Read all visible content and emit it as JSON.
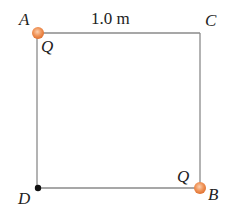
{
  "diagram": {
    "type": "square-charge-configuration",
    "side_length_label": "1.0 m",
    "corners": {
      "A": {
        "label": "A",
        "charge_label": "Q",
        "has_charge": true
      },
      "B": {
        "label": "B",
        "charge_label": "Q",
        "has_charge": true
      },
      "C": {
        "label": "C",
        "has_charge": false
      },
      "D": {
        "label": "D",
        "has_charge": false,
        "marked_point": true
      }
    },
    "colors": {
      "charge_fill": "#f0955a",
      "charge_edge": "#e8773d",
      "line": "#888888",
      "point": "#111111"
    }
  }
}
